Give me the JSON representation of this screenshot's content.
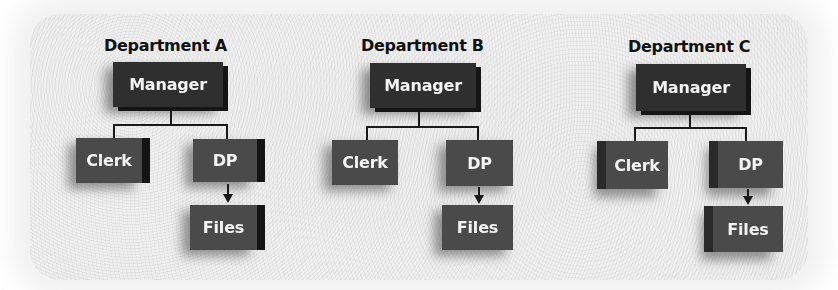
{
  "diagram": {
    "type": "org-chart",
    "departments": [
      {
        "title": "Department A",
        "manager": "Manager",
        "children": [
          "Clerk",
          "DP"
        ],
        "dp_child": "Files"
      },
      {
        "title": "Department B",
        "manager": "Manager",
        "children": [
          "Clerk",
          "DP"
        ],
        "dp_child": "Files"
      },
      {
        "title": "Department C",
        "manager": "Manager",
        "children": [
          "Clerk",
          "DP"
        ],
        "dp_child": "Files"
      }
    ],
    "colors": {
      "manager_box": "#2f2f2f",
      "sub_box": "#4a4a4a",
      "box_text": "#f4f4f4",
      "title_text": "#111111",
      "connector": "#1a1a1a",
      "background": "#eeeeee"
    }
  }
}
